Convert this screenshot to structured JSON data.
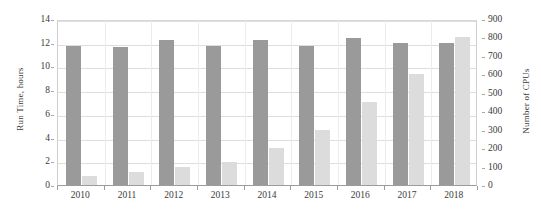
{
  "chart_data": {
    "type": "bar",
    "title": "",
    "subtitle": "",
    "xlabel": "",
    "ylabel": "Run Time, hours",
    "y2label": "Number of CPUs",
    "categories": [
      "2010",
      "2011",
      "2012",
      "2013",
      "2014",
      "2015",
      "2016",
      "2017",
      "2018"
    ],
    "series": [
      {
        "name": "Run Time, hours",
        "axis": "left",
        "color": "#9a9a9a",
        "values": [
          11.7,
          11.6,
          12.2,
          11.7,
          12.2,
          11.7,
          12.4,
          12.0,
          12.0
        ]
      },
      {
        "name": "Number of CPUs",
        "axis": "right",
        "color": "#dcdcdc",
        "values": [
          50,
          70,
          95,
          125,
          200,
          300,
          450,
          600,
          800
        ]
      }
    ],
    "ylim": [
      0,
      14
    ],
    "y2lim": [
      0,
      900
    ],
    "yticks": [
      "0",
      "2",
      "4",
      "6",
      "8",
      "10",
      "12",
      "14"
    ],
    "ytick_values": [
      0,
      2,
      4,
      6,
      8,
      10,
      12,
      14
    ],
    "y2ticks": [
      "0",
      "100",
      "200",
      "300",
      "400",
      "500",
      "600",
      "700",
      "800",
      "900"
    ],
    "y2tick_values": [
      0,
      100,
      200,
      300,
      400,
      500,
      600,
      700,
      800,
      900
    ],
    "grid": true,
    "grid_axis": "y",
    "legend": false,
    "legend_position": "none",
    "annotations": []
  }
}
